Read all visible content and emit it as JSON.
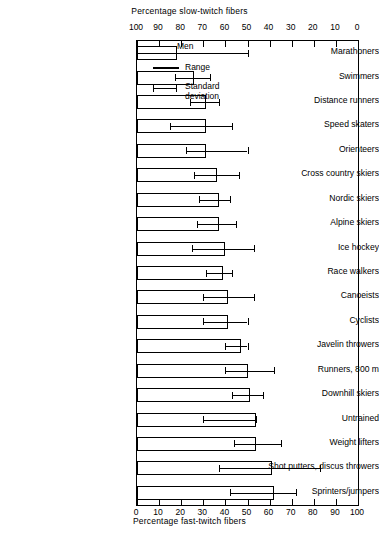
{
  "chart_data": {
    "type": "bar",
    "title": "Percentage slow-twitch fibers",
    "xlabel": "Percentage fast-twitch fibers",
    "ylabel": "",
    "top_axis_label": "Percentage slow-twitch fibers",
    "bottom_axis_label": "Percentage fast-twitch fibers",
    "top_ticks": [
      100,
      90,
      80,
      70,
      60,
      50,
      40,
      30,
      20,
      10,
      0
    ],
    "bottom_ticks": [
      0,
      10,
      20,
      30,
      40,
      50,
      60,
      70,
      80,
      90,
      100
    ],
    "xlim": [
      0,
      100
    ],
    "grid": false,
    "legend": {
      "title": "Men",
      "entries": [
        {
          "label": "Range",
          "marker": "thick-line"
        },
        {
          "label": "Standard deviation",
          "marker": "capped-line"
        }
      ],
      "position": "top-right"
    },
    "units": "percent fast-twitch fibers",
    "categories": [
      "Marathoners",
      "Swimmers",
      "Distance runners",
      "Speed skaters",
      "Orienteers",
      "Cross country skiers",
      "Nordic skiers",
      "Alpine skiers",
      "Ice hockey",
      "Race walkers",
      "Canoeists",
      "Cyclists",
      "Javelin throwers",
      "Runners, 800 m",
      "Downhill skiers",
      "Untrained",
      "Weight lifters",
      "Shot putters, discus throwers",
      "Sprinters/jumpers"
    ],
    "series": [
      {
        "name": "Range",
        "note": "box spans range of fast-twitch percentage from 0 to range_max",
        "values": [
          18,
          26,
          31,
          31,
          31,
          36,
          37,
          37,
          40,
          39,
          41,
          41,
          47,
          50,
          51,
          54,
          54,
          61,
          62
        ]
      },
      {
        "name": "Standard deviation",
        "note": "capped horizontal line, low to high fast-twitch percentage",
        "low": [
          0,
          17,
          24,
          15,
          22,
          26,
          28,
          27,
          25,
          31,
          30,
          30,
          40,
          40,
          43,
          30,
          44,
          37,
          42
        ],
        "high": [
          50,
          33,
          37,
          43,
          50,
          46,
          42,
          45,
          53,
          43,
          53,
          50,
          50,
          62,
          57,
          54,
          65,
          83,
          72
        ]
      }
    ]
  }
}
